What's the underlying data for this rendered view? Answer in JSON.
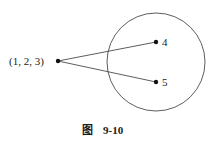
{
  "diagram": {
    "type": "mapping",
    "source_point": {
      "label": "(1, 2, 3)"
    },
    "target_set": {
      "shape": "circle",
      "points": [
        {
          "label": "4"
        },
        {
          "label": "5"
        }
      ]
    },
    "edges": [
      {
        "from": "(1, 2, 3)",
        "to": "4"
      },
      {
        "from": "(1, 2, 3)",
        "to": "5"
      }
    ]
  },
  "caption": {
    "prefix": "图",
    "number": "9-10"
  }
}
